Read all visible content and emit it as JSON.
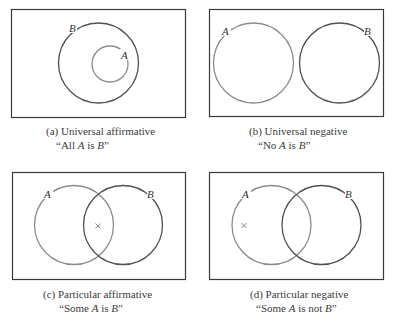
{
  "figure": {
    "colors": {
      "box_border": "#3a3a3a",
      "circle_a": "#8c8c8c",
      "circle_b": "#505050",
      "text": "#333333"
    },
    "panels": [
      {
        "id": "a",
        "type": "universal-affirmative",
        "caption_line1": "(a) Universal affirmative",
        "caption_line2_open": "“All ",
        "caption_line2_a": "A",
        "caption_line2_mid": " is ",
        "caption_line2_b": "B",
        "caption_line2_close": "”",
        "label_a": "A",
        "label_b": "B",
        "marker": ""
      },
      {
        "id": "b",
        "type": "universal-negative",
        "caption_line1": "(b) Universal negative",
        "caption_line2_open": "“No ",
        "caption_line2_a": "A",
        "caption_line2_mid": " is ",
        "caption_line2_b": "B",
        "caption_line2_close": "”",
        "label_a": "A",
        "label_b": "B",
        "marker": ""
      },
      {
        "id": "c",
        "type": "particular-affirmative",
        "caption_line1": "(c) Particular affirmative",
        "caption_line2_open": "“Some ",
        "caption_line2_a": "A",
        "caption_line2_mid": " is ",
        "caption_line2_b": "B",
        "caption_line2_close": "”",
        "label_a": "A",
        "label_b": "B",
        "marker": "×"
      },
      {
        "id": "d",
        "type": "particular-negative",
        "caption_line1": "(d) Particular negative",
        "caption_line2_open": "“Some ",
        "caption_line2_a": "A",
        "caption_line2_mid": " is not ",
        "caption_line2_b": "B",
        "caption_line2_close": "”",
        "label_a": "A",
        "label_b": "B",
        "marker": "×"
      }
    ]
  }
}
